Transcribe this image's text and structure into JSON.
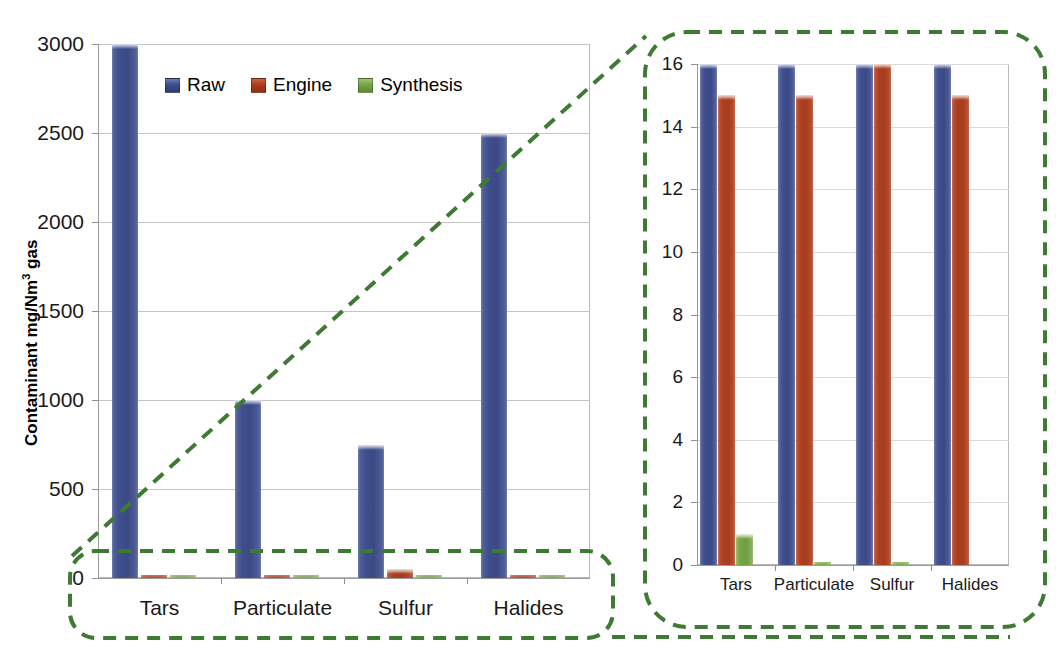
{
  "figure": {
    "left_panel": {
      "ylabel": "Contaminant mg/Nm",
      "ylabel_sup": "3",
      "ylabel_tail": " gas"
    },
    "legend": {
      "position": "top-left-inside",
      "items": [
        {
          "label": "Raw",
          "color": "#3f4f8d",
          "icon": "legend-swatch-raw"
        },
        {
          "label": "Engine",
          "color": "#ac3f21",
          "icon": "legend-swatch-engine"
        },
        {
          "label": "Synthesis",
          "color": "#76a444",
          "icon": "legend-swatch-synthesis"
        }
      ]
    },
    "callout": {
      "color": "#3f7a34",
      "style": "dashed",
      "description": "zoom callout connecting lower band of left chart to right chart"
    }
  },
  "chart_data": [
    {
      "id": "left-chart",
      "type": "bar",
      "title": "",
      "xlabel": "",
      "ylabel": "Contaminant mg/Nm3 gas",
      "categories": [
        "Tars",
        "Particulate",
        "Sulfur",
        "Halides"
      ],
      "ylim": [
        0,
        3000
      ],
      "yticks": [
        0,
        500,
        1000,
        1500,
        2000,
        2500,
        3000
      ],
      "ytick_labels": [
        "0",
        "500",
        "1000",
        "1500",
        "2000",
        "2500",
        "3000"
      ],
      "grid": true,
      "legend": [
        "Raw",
        "Engine",
        "Synthesis"
      ],
      "series": [
        {
          "name": "Raw",
          "color": "#3f4f8d",
          "values": [
            3000,
            1000,
            750,
            2500
          ]
        },
        {
          "name": "Engine",
          "color": "#ac3f21",
          "values": [
            16,
            15,
            50,
            15
          ]
        },
        {
          "name": "Synthesis",
          "color": "#76a444",
          "values": [
            1,
            0.1,
            0.1,
            0.05
          ]
        }
      ]
    },
    {
      "id": "right-chart-zoom",
      "type": "bar",
      "title": "",
      "xlabel": "",
      "ylabel": "",
      "categories": [
        "Tars",
        "Particulate",
        "Sulfur",
        "Halides"
      ],
      "ylim": [
        0,
        16
      ],
      "yticks": [
        0,
        2,
        4,
        6,
        8,
        10,
        12,
        14,
        16
      ],
      "ytick_labels": [
        "0",
        "2",
        "4",
        "6",
        "8",
        "10",
        "12",
        "14",
        "16"
      ],
      "grid": true,
      "legend": [
        "Raw",
        "Engine",
        "Synthesis"
      ],
      "note": "magnified view of the 0-16 band of the left chart; Raw bars are clipped at the 16 ceiling",
      "series": [
        {
          "name": "Raw",
          "color": "#3f4f8d",
          "values": [
            16,
            16,
            16,
            16
          ]
        },
        {
          "name": "Engine",
          "color": "#ac3f21",
          "values": [
            15,
            15,
            16,
            15
          ]
        },
        {
          "name": "Synthesis",
          "color": "#76a444",
          "values": [
            1,
            0.1,
            0.1,
            0.0
          ]
        }
      ]
    }
  ]
}
